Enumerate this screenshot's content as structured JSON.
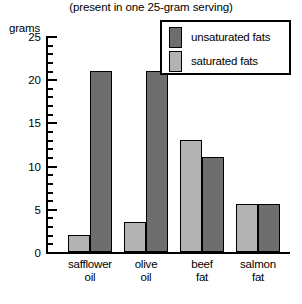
{
  "chart_data": {
    "type": "bar",
    "title": "",
    "subtitle": "(present in one 25-gram serving)",
    "xlabel": "",
    "ylabel": "grams",
    "ylim": [
      0,
      25
    ],
    "ytick_step_major": 5,
    "ytick_step_minor": 1,
    "ytick_labels": [
      "0",
      "5",
      "10",
      "15",
      "20",
      "25"
    ],
    "grid": false,
    "legend_position": "top-right",
    "categories": [
      "safflower oil",
      "olive oil",
      "beef fat",
      "salmon fat"
    ],
    "category_lines": [
      [
        "safflower",
        "oil"
      ],
      [
        "olive",
        "oil"
      ],
      [
        "beef",
        "fat"
      ],
      [
        "salmon",
        "fat"
      ]
    ],
    "series": [
      {
        "name": "saturated fats",
        "color": "#b3b3b3",
        "values": [
          2,
          3.5,
          13,
          5.5
        ]
      },
      {
        "name": "unsaturated fats",
        "color": "#6e6e6e",
        "values": [
          21,
          21,
          11,
          5.5
        ]
      }
    ]
  },
  "legend": {
    "items": [
      {
        "label": "unsaturated fats",
        "color": "#6e6e6e"
      },
      {
        "label": "saturated fats",
        "color": "#b3b3b3"
      }
    ]
  }
}
